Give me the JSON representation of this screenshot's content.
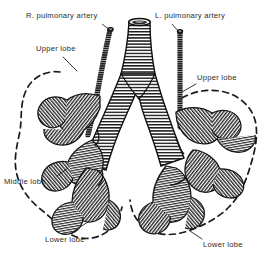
{
  "figure": {
    "style": "engraving",
    "background_color": "#ffffff",
    "ink_color": "#1a1a1a",
    "label_color": "#2b2b2b"
  },
  "labels": {
    "right_pulmonary_artery": "R. pulmonary artery",
    "left_pulmonary_artery": "L. pulmonary artery",
    "upper_lobe_left": "Upper lobe",
    "upper_lobe_right": "Upper lobe",
    "middle_lobe": "Middle lobe",
    "lower_lobe_left": "Lower lobe",
    "lower_lobe_right": "Lower lobe"
  },
  "structures": {
    "trachea": "trachea",
    "right_main_bronchus": "right-main-bronchus",
    "left_main_bronchus": "left-main-bronchus",
    "right_pulmonary_artery": "right-pulmonary-artery",
    "left_pulmonary_artery": "left-pulmonary-artery",
    "lung_outline_right": "right-lung-dashed-outline",
    "lung_outline_left": "left-lung-dashed-outline"
  }
}
